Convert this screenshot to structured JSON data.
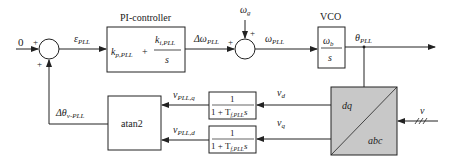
{
  "diagram": {
    "input_reference": "0",
    "sum1": {
      "sign_top": "+",
      "sign_bottom": "+"
    },
    "error_signal": {
      "symbol": "ε",
      "sub": "PLL"
    },
    "pi_controller": {
      "label": "PI-controller",
      "kp": "k",
      "kp_sub": "p,PLL",
      "plus": "+",
      "ki": "k",
      "ki_sub": "i,PLL",
      "den": "s"
    },
    "delta_omega": {
      "symbol": "Δω",
      "sub": "PLL"
    },
    "omega_g": {
      "symbol": "ω",
      "sub": "g"
    },
    "sum2": {
      "sign_left": "+",
      "sign_top": "+"
    },
    "omega_pll": {
      "symbol": "ω",
      "sub": "PLL"
    },
    "vco": {
      "label": "VCO",
      "num": "ω",
      "num_sub": "b",
      "den": "s"
    },
    "theta_pll": {
      "symbol": "θ",
      "sub": "PLL"
    },
    "transform": {
      "top": "dq",
      "bottom": "abc",
      "fill": "#c8c8c8"
    },
    "input_v": {
      "symbol": "v"
    },
    "v_d": {
      "symbol": "v",
      "sub": "d"
    },
    "v_q": {
      "symbol": "v",
      "sub": "q"
    },
    "lpf_top": {
      "num": "1",
      "den": "1 + T",
      "den_sub": "f,PLL",
      "den_s": "s"
    },
    "lpf_bottom": {
      "num": "1",
      "den": "1 + T",
      "den_sub": "f,PLL",
      "den_s": "s"
    },
    "v_pll_q": {
      "symbol": "v",
      "sub": "PLL,q"
    },
    "v_pll_d": {
      "symbol": "v",
      "sub": "PLL,d"
    },
    "atan2": {
      "label": "atan2"
    },
    "delta_theta": {
      "symbol": "Δθ",
      "sub": "v-PLL"
    }
  }
}
